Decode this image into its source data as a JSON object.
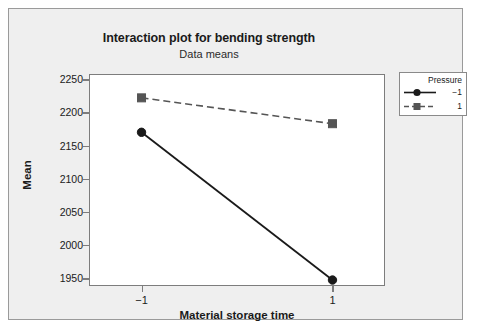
{
  "chart_data": {
    "type": "line",
    "title": "Interaction plot for bending strength",
    "subtitle": "Data means",
    "xlabel": "Material storage time",
    "ylabel": "Mean",
    "categories": [
      "−1",
      "1"
    ],
    "x": [
      -1,
      1
    ],
    "xlim": [
      -1.55,
      1.55
    ],
    "ylim": [
      1938,
      2258
    ],
    "yticks": [
      1950,
      2000,
      2050,
      2100,
      2150,
      2200,
      2250
    ],
    "ytick_labels": [
      "1950",
      "2000",
      "2050",
      "2100",
      "2150",
      "2200",
      "2250"
    ],
    "xticks": [
      -1,
      1
    ],
    "xtick_labels": [
      "−1",
      "1"
    ],
    "grid": false,
    "legend_position": "right-top",
    "legend_title": "Pressure",
    "series": [
      {
        "name": "−1",
        "values": [
          2170,
          1947
        ],
        "marker": "circle",
        "linestyle": "solid",
        "color": "#1a1a1a"
      },
      {
        "name": "1",
        "values": [
          2222,
          2183
        ],
        "marker": "square",
        "linestyle": "dashed",
        "color": "#555555"
      }
    ]
  },
  "legend": {
    "title": "Pressure",
    "entries": [
      {
        "label": "−1",
        "marker": "circle-marker",
        "line": "solid"
      },
      {
        "label": "1",
        "marker": "square-marker",
        "line": "dashed"
      }
    ]
  },
  "colors": {
    "page_background": "#ffffff",
    "panel_background": "#efefef",
    "plot_background": "#ffffff",
    "frame": "#7d7d7d",
    "series_1": "#1a1a1a",
    "series_2": "#555555",
    "text": "#1a1a1a"
  }
}
